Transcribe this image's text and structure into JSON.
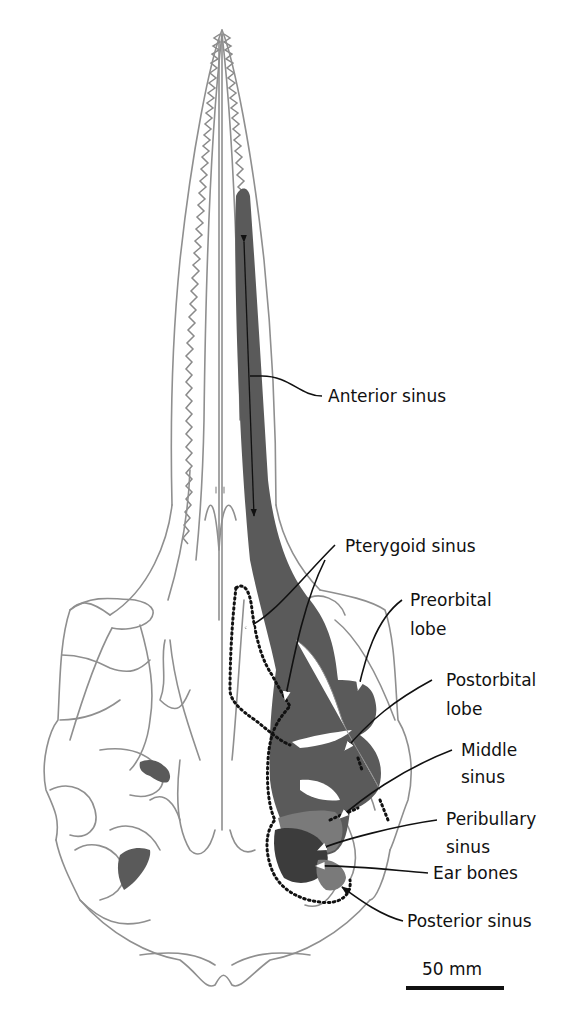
{
  "figure": {
    "colors": {
      "bone_outline": "#8f8f8f",
      "sinus_fill": "#5a5a5a",
      "ear_bones_fill": "#3c3c3c",
      "pterygoid_outline": "#111111",
      "background": "#ffffff"
    }
  },
  "labels": {
    "anterior_sinus": "Anterior sinus",
    "pterygoid_sinus": "Pterygoid sinus",
    "preorbital_lobe_1": "Preorbital",
    "preorbital_lobe_2": "lobe",
    "postorbital_lobe_1": "Postorbital",
    "postorbital_lobe_2": "lobe",
    "middle_sinus_1": "Middle",
    "middle_sinus_2": "sinus",
    "peribullary_sinus_1": "Peribullary",
    "peribullary_sinus_2": "sinus",
    "ear_bones": "Ear bones",
    "posterior_sinus": "Posterior sinus"
  },
  "scale_bar": {
    "label": "50 mm",
    "value": 50,
    "unit": "mm"
  }
}
